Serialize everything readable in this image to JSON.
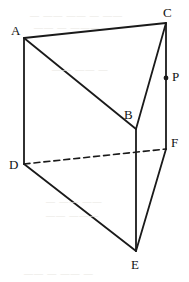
{
  "figure": {
    "type": "geometry-diagram",
    "width": 189,
    "height": 282,
    "background_color": "#ffffff",
    "stroke_color": "#1a1a1a",
    "solid_stroke_width": 1.8,
    "dashed_stroke_width": 1.6,
    "dash_pattern": "6 4"
  },
  "vertices": [
    {
      "id": "A",
      "label": "A",
      "x": 24,
      "y": 38,
      "label_x": 11,
      "label_y": 24,
      "hidden": false
    },
    {
      "id": "B",
      "label": "B",
      "x": 136,
      "y": 129,
      "label_x": 124,
      "label_y": 108,
      "hidden": false
    },
    {
      "id": "C",
      "label": "C",
      "x": 166,
      "y": 23,
      "label_x": 163,
      "label_y": 6,
      "hidden": false
    },
    {
      "id": "D",
      "label": "D",
      "x": 24,
      "y": 164,
      "label_x": 9,
      "label_y": 158,
      "hidden": false
    },
    {
      "id": "E",
      "label": "E",
      "x": 136,
      "y": 251,
      "label_x": 131,
      "label_y": 258,
      "hidden": false
    },
    {
      "id": "F",
      "label": "F",
      "x": 166,
      "y": 149,
      "label_x": 171,
      "label_y": 136,
      "hidden": false
    }
  ],
  "points": [
    {
      "id": "P",
      "label": "P",
      "x": 166,
      "y": 78,
      "label_x": 172,
      "label_y": 70,
      "marker": "filled-dot",
      "radius": 2.4,
      "on_edge": "CF"
    }
  ],
  "edges": [
    {
      "id": "AC",
      "from": "A",
      "to": "C",
      "style": "solid",
      "x1": 24,
      "y1": 38,
      "x2": 166,
      "y2": 23
    },
    {
      "id": "AB",
      "from": "A",
      "to": "B",
      "style": "solid",
      "x1": 24,
      "y1": 38,
      "x2": 136,
      "y2": 129
    },
    {
      "id": "BC",
      "from": "B",
      "to": "C",
      "style": "solid",
      "x1": 136,
      "y1": 129,
      "x2": 166,
      "y2": 23
    },
    {
      "id": "AD",
      "from": "A",
      "to": "D",
      "style": "solid",
      "x1": 24,
      "y1": 38,
      "x2": 24,
      "y2": 164
    },
    {
      "id": "BE",
      "from": "B",
      "to": "E",
      "style": "solid",
      "x1": 136,
      "y1": 129,
      "x2": 136,
      "y2": 251
    },
    {
      "id": "CF",
      "from": "C",
      "to": "F",
      "style": "solid",
      "x1": 166,
      "y1": 23,
      "x2": 166,
      "y2": 149
    },
    {
      "id": "DE",
      "from": "D",
      "to": "E",
      "style": "solid",
      "x1": 24,
      "y1": 164,
      "x2": 136,
      "y2": 251
    },
    {
      "id": "EF",
      "from": "E",
      "to": "F",
      "style": "solid",
      "x1": 136,
      "y1": 251,
      "x2": 166,
      "y2": 149
    },
    {
      "id": "DF",
      "from": "D",
      "to": "F",
      "style": "dashed",
      "x1": 24,
      "y1": 164,
      "x2": 166,
      "y2": 149
    }
  ],
  "background_artifacts": [
    {
      "text": "— —— —— — ——",
      "x": 30,
      "y": 10
    },
    {
      "text": "—— — ———",
      "x": 34,
      "y": 22
    },
    {
      "text": "——  —— —",
      "x": 52,
      "y": 64
    },
    {
      "text": "— —— ——",
      "x": 46,
      "y": 196
    },
    {
      "text": "—— ———",
      "x": 46,
      "y": 210
    },
    {
      "text": "—— — —— —",
      "x": 24,
      "y": 268
    }
  ]
}
